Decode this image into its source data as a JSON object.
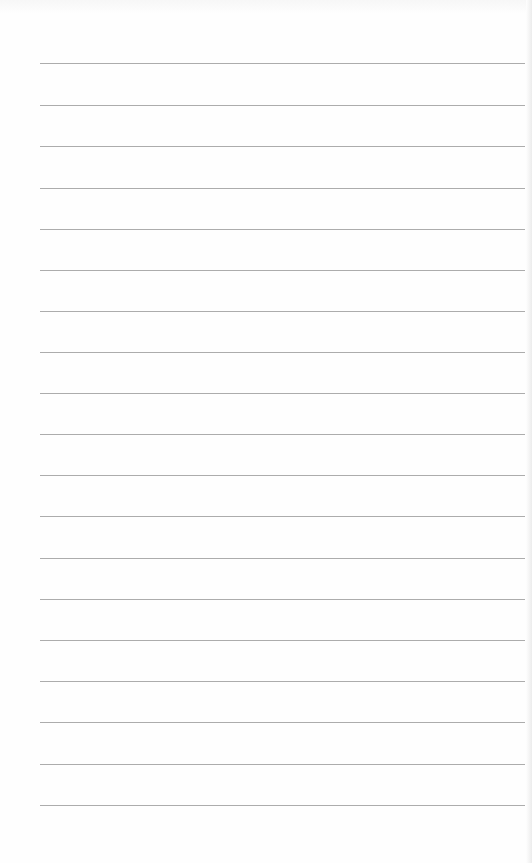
{
  "document": {
    "type": "lined-paper",
    "background_color": "#fefefe",
    "line_color": "#9e9e9e",
    "line_left": 40,
    "line_right": 525,
    "line_positions_y": [
      63,
      105,
      146,
      188,
      229,
      270,
      311,
      352,
      393,
      434,
      475,
      516,
      558,
      599,
      640,
      681,
      722,
      764,
      805
    ],
    "line_count": 19
  }
}
